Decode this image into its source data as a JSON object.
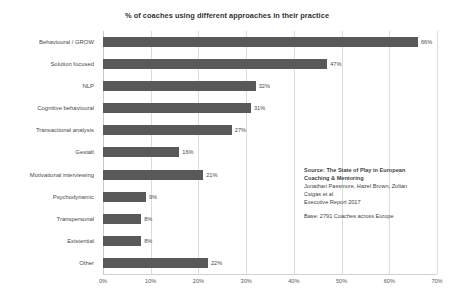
{
  "chart_data": {
    "type": "bar",
    "orientation": "horizontal",
    "title": "% of coaches using different approaches in their practice",
    "xlabel": "",
    "ylabel": "",
    "xlim": [
      0,
      70
    ],
    "xticks": [
      "0%",
      "10%",
      "20%",
      "30%",
      "40%",
      "50%",
      "60%",
      "70%"
    ],
    "xtick_values": [
      0,
      10,
      20,
      30,
      40,
      50,
      60,
      70
    ],
    "grid": true,
    "legend": "none",
    "bar_color": "#595959",
    "categories": [
      "Behavioural / GROW",
      "Solution focused",
      "NLP",
      "Cognitive behavioural",
      "Transactional analysis",
      "Gestalt",
      "Motivational interviewing",
      "Psychodynamic",
      "Transpersonal",
      "Existential",
      "Other"
    ],
    "values": [
      66,
      47,
      32,
      31,
      27,
      16,
      21,
      9,
      8,
      8,
      22
    ],
    "data_labels": [
      "66%",
      "47%",
      "32%",
      "31%",
      "27%",
      "16%",
      "21%",
      "9%",
      "8%",
      "8%",
      "22%"
    ]
  },
  "annotations": {
    "source_line1": "Source: The State of Play in European",
    "source_line2": "Coaching & Mentoring",
    "source_line3": "Jonathan Passmore, Hazel Brown, Zoltan",
    "source_line4": "Csigas et al",
    "source_line5": "Executive Report 2017",
    "base_line": "Base: 2791 Coaches across Europe"
  }
}
